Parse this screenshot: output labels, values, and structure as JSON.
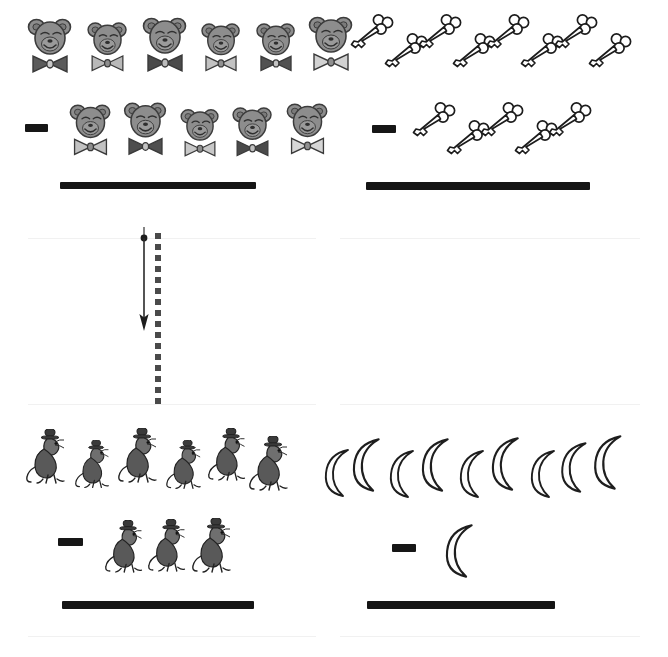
{
  "worksheet": {
    "title": "Picture Subtraction Worksheet",
    "operator_symbol": "minus-bar",
    "answer_line_label": "blank answer line",
    "fold_marker": "dashed-cut-line-with-down-arrow"
  },
  "problems": [
    {
      "id": "problem-top-left",
      "position": "top-left",
      "icon": "bear-head-with-bowtie",
      "minuend": 6,
      "subtrahend": 5,
      "operator": "−",
      "answer": "",
      "row1_items": [
        {
          "bowtie_color": "#5b5b5b",
          "size": 1.0
        },
        {
          "bowtie_color": "#b9b9b9",
          "size": 0.9
        },
        {
          "bowtie_color": "#4a4a4a",
          "size": 1.0
        },
        {
          "bowtie_color": "#c2c2c2",
          "size": 0.88
        },
        {
          "bowtie_color": "#515151",
          "size": 0.88
        },
        {
          "bowtie_color": "#d2d2d2",
          "size": 1.0
        }
      ],
      "row2_items": [
        {
          "bowtie_color": "#c2c2c2",
          "size": 0.95
        },
        {
          "bowtie_color": "#4f4f4f",
          "size": 0.98
        },
        {
          "bowtie_color": "#c8c8c8",
          "size": 0.88
        },
        {
          "bowtie_color": "#4a4a4a",
          "size": 0.9
        },
        {
          "bowtie_color": "#d6d6d6",
          "size": 0.95
        }
      ]
    },
    {
      "id": "problem-top-right",
      "position": "top-right",
      "icon": "skeleton-key",
      "minuend": 8,
      "subtrahend": 5,
      "operator": "−",
      "answer": "",
      "row1_count": 8,
      "row2_count": 5
    },
    {
      "id": "problem-bottom-left",
      "position": "bottom-left",
      "icon": "mouse-with-hat",
      "minuend": 6,
      "subtrahend": 3,
      "operator": "−",
      "answer": "",
      "row1_count": 6,
      "row2_count": 3
    },
    {
      "id": "problem-bottom-right",
      "position": "bottom-right",
      "icon": "crescent-moon",
      "minuend": 9,
      "subtrahend": 1,
      "operator": "−",
      "answer": "",
      "row1_count": 9,
      "row2_count": 1
    }
  ],
  "colors": {
    "ink": "#151515",
    "bear_fill": "#8d8d8d",
    "bear_outline": "#3c3c3c",
    "key_outline": "#1c1c1c",
    "key_fill": "#ffffff",
    "mouse_ink": "#2a2a2a",
    "moon_outline": "#1e1e1e",
    "moon_fill": "#fdfdfd",
    "guide_rule": "#f1f1f1",
    "fold_dash": "#4a4a4a"
  }
}
